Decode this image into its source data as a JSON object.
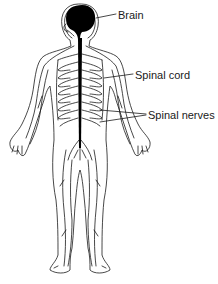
{
  "diagram": {
    "labels": [
      {
        "id": "brain",
        "text": "Brain"
      },
      {
        "id": "spinal_cord",
        "text": "Spinal cord"
      },
      {
        "id": "spinal_nerves",
        "text": "Spinal nerves"
      }
    ]
  },
  "colors": {
    "outline": "#1a1a1a",
    "cns_fill": "#000000",
    "background": "#ffffff"
  }
}
